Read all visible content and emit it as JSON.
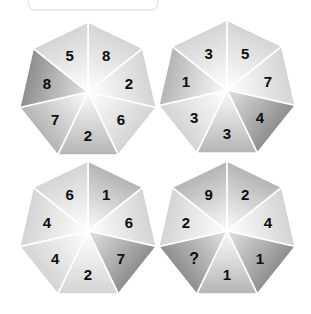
{
  "background_color": "#ffffff",
  "top_bar": {
    "name": "toolbar-strip",
    "visible": true
  },
  "puzzle": {
    "type": "heptagon-number-puzzle",
    "shape_sides": 7,
    "segments_per_shape": 7,
    "missing_marker": "?",
    "label_color": "#0d0d0d",
    "shapes": [
      {
        "id": "heptagon-1",
        "position": "top-left",
        "center": [
          88,
          92
        ],
        "segments": [
          {
            "index": 0,
            "value": "8",
            "shade": "light"
          },
          {
            "index": 1,
            "value": "2",
            "shade": "light"
          },
          {
            "index": 2,
            "value": "6",
            "shade": "light"
          },
          {
            "index": 3,
            "value": "2",
            "shade": "medium"
          },
          {
            "index": 4,
            "value": "7",
            "shade": "medium"
          },
          {
            "index": 5,
            "value": "8",
            "shade": "dark"
          },
          {
            "index": 6,
            "value": "5",
            "shade": "light"
          }
        ]
      },
      {
        "id": "heptagon-2",
        "position": "top-right",
        "center": [
          227,
          90
        ],
        "segments": [
          {
            "index": 0,
            "value": "5",
            "shade": "light"
          },
          {
            "index": 1,
            "value": "7",
            "shade": "light"
          },
          {
            "index": 2,
            "value": "4",
            "shade": "dark"
          },
          {
            "index": 3,
            "value": "3",
            "shade": "medium"
          },
          {
            "index": 4,
            "value": "3",
            "shade": "light"
          },
          {
            "index": 5,
            "value": "1",
            "shade": "medium"
          },
          {
            "index": 6,
            "value": "3",
            "shade": "light"
          }
        ]
      },
      {
        "id": "heptagon-3",
        "position": "bottom-left",
        "center": [
          88,
          230
        ],
        "segments": [
          {
            "index": 0,
            "value": "1",
            "shade": "medium"
          },
          {
            "index": 1,
            "value": "6",
            "shade": "light"
          },
          {
            "index": 2,
            "value": "7",
            "shade": "dark"
          },
          {
            "index": 3,
            "value": "2",
            "shade": "light"
          },
          {
            "index": 4,
            "value": "4",
            "shade": "light"
          },
          {
            "index": 5,
            "value": "4",
            "shade": "light"
          },
          {
            "index": 6,
            "value": "6",
            "shade": "light"
          }
        ]
      },
      {
        "id": "heptagon-4",
        "position": "bottom-right",
        "center": [
          227,
          230
        ],
        "segments": [
          {
            "index": 0,
            "value": "2",
            "shade": "medium"
          },
          {
            "index": 1,
            "value": "4",
            "shade": "light"
          },
          {
            "index": 2,
            "value": "1",
            "shade": "dark"
          },
          {
            "index": 3,
            "value": "1",
            "shade": "medium"
          },
          {
            "index": 4,
            "value": "?",
            "shade": "dark"
          },
          {
            "index": 5,
            "value": "2",
            "shade": "light"
          },
          {
            "index": 6,
            "value": "9",
            "shade": "medium"
          }
        ]
      }
    ]
  }
}
